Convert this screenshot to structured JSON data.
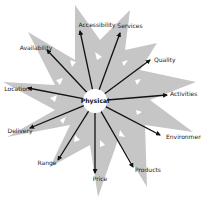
{
  "diagram": {
    "title": "",
    "center": {
      "label": "Physical",
      "x": 95,
      "y": 101,
      "r": 12
    },
    "colors": {
      "star_fill": "#c6c6c6",
      "hole_fill": "#ffffff",
      "arrow": "#111111",
      "center_fill": "#ffffff",
      "text": "#1a1a1a"
    },
    "spokes": [
      {
        "label": "Accessibility",
        "end": [
          80,
          31
        ],
        "text": [
          97,
          27
        ],
        "anchor": "middle"
      },
      {
        "label": "Services",
        "end": [
          120,
          33
        ],
        "text": [
          130,
          28
        ],
        "anchor": "middle"
      },
      {
        "label": "Quality",
        "end": [
          150,
          60
        ],
        "text": [
          154,
          62
        ],
        "anchor": "start"
      },
      {
        "label": "Activities",
        "end": [
          167,
          95
        ],
        "text": [
          170,
          96
        ],
        "anchor": "start"
      },
      {
        "label": "Environment",
        "end": [
          160,
          135
        ],
        "text": [
          166,
          139
        ],
        "anchor": "start"
      },
      {
        "label": "Products",
        "end": [
          133,
          167
        ],
        "text": [
          135,
          172
        ],
        "anchor": "start"
      },
      {
        "label": "Price",
        "end": [
          95,
          173
        ],
        "text": [
          100,
          181
        ],
        "anchor": "middle"
      },
      {
        "label": "Range",
        "end": [
          58,
          160
        ],
        "text": [
          47,
          165
        ],
        "anchor": "middle"
      },
      {
        "label": "Delivery",
        "end": [
          30,
          128
        ],
        "text": [
          20,
          133
        ],
        "anchor": "middle"
      },
      {
        "label": "Location",
        "end": [
          28,
          88
        ],
        "text": [
          17,
          91
        ],
        "anchor": "middle"
      },
      {
        "label": "Availability",
        "end": [
          47,
          50
        ],
        "text": [
          36,
          50
        ],
        "anchor": "middle"
      }
    ],
    "star_points": [
      [
        75,
        5
      ],
      [
        100,
        40
      ],
      [
        130,
        10
      ],
      [
        125,
        50
      ],
      [
        157,
        43
      ],
      [
        140,
        70
      ],
      [
        196,
        82
      ],
      [
        150,
        100
      ],
      [
        193,
        132
      ],
      [
        145,
        125
      ],
      [
        147,
        187
      ],
      [
        118,
        140
      ],
      [
        98,
        197
      ],
      [
        90,
        145
      ],
      [
        50,
        167
      ],
      [
        70,
        125
      ],
      [
        7,
        137
      ],
      [
        55,
        110
      ],
      [
        3,
        82
      ],
      [
        55,
        85
      ],
      [
        28,
        32
      ],
      [
        75,
        60
      ]
    ]
  }
}
